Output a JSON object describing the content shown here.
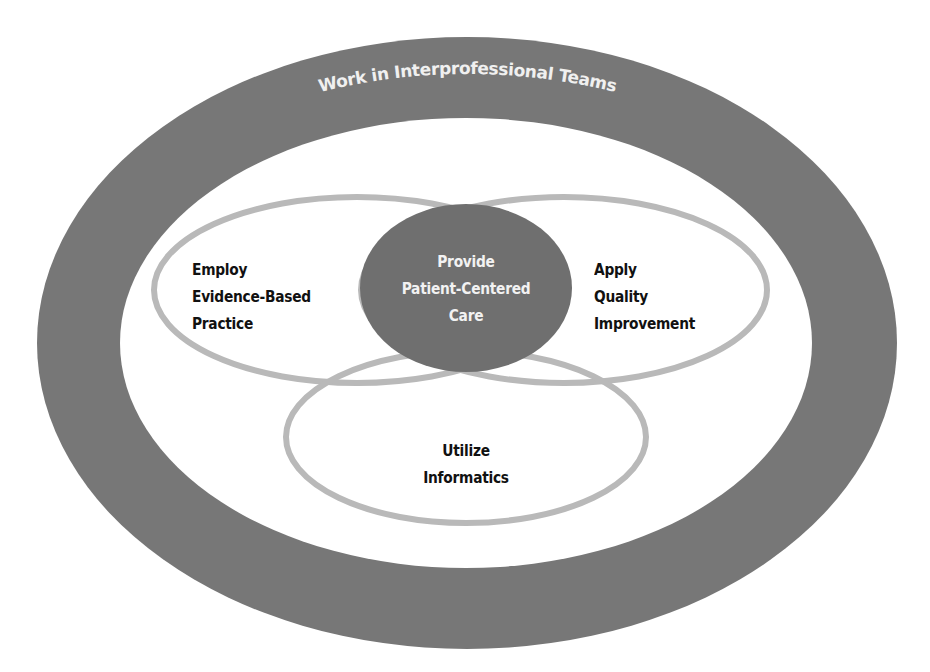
{
  "diagram": {
    "outer_ring": {
      "label": "Work in Interprofessional Teams",
      "fill_color": "#777777"
    },
    "center": {
      "lines": [
        "Provide",
        "Patient-Centered",
        "Care"
      ],
      "fill_color": "#6f6f6f",
      "text_color": "#f2f2f2"
    },
    "left_ellipse": {
      "lines": [
        "Employ",
        "Evidence-Based",
        "Practice"
      ]
    },
    "right_ellipse": {
      "lines": [
        "Apply",
        "Quality",
        "Improvement"
      ]
    },
    "bottom_ellipse": {
      "lines": [
        "Utilize",
        "Informatics"
      ]
    },
    "ring_stroke_color": "#b9b9b9",
    "background_color": "#ffffff"
  }
}
